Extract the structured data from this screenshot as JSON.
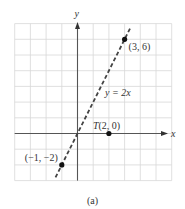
{
  "chart_data": {
    "type": "line",
    "title": "",
    "caption": "(a)",
    "xlabel": "x",
    "ylabel": "y",
    "xlim": [
      -4,
      6
    ],
    "ylim": [
      -3,
      7
    ],
    "grid": true,
    "grid_step": 1,
    "series": [
      {
        "name": "y = 2x",
        "style": "dashed",
        "color": "#444444",
        "equation": "y = 2x",
        "x": [
          -1.4,
          3.35
        ],
        "y": [
          -2.8,
          6.7
        ]
      }
    ],
    "points": [
      {
        "label": "(3, 6)",
        "x": 3,
        "y": 6
      },
      {
        "label": "(−1, −2)",
        "x": -1,
        "y": -2
      },
      {
        "label": "T(2, 0)",
        "x": 2,
        "y": 0
      }
    ],
    "annotations": [
      {
        "text": "y = 2x",
        "x": 1.8,
        "y": 2.6
      }
    ]
  },
  "labels": {
    "x_axis": "x",
    "y_axis": "y",
    "line_equation": "y = 2x",
    "point_a": "(3, 6)",
    "point_b": "(−1, −2)",
    "point_t": "T(2, 0)",
    "caption": "(a)"
  },
  "colors": {
    "grid": "#d8d8d8",
    "axis": "#555555",
    "line": "#444444",
    "point": "#111111",
    "text": "#333333"
  }
}
